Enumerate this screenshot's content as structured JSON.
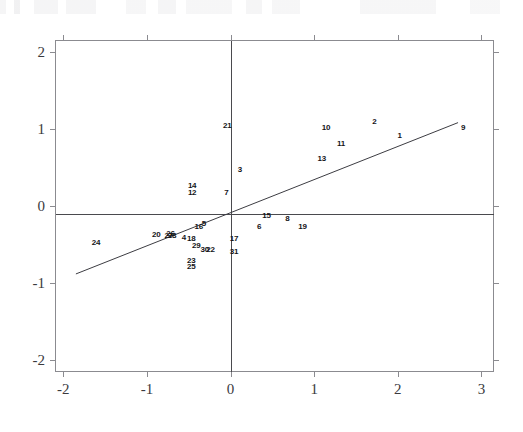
{
  "chart_data": {
    "type": "scatter",
    "title": "",
    "subtitle": "",
    "xlabel": "",
    "ylabel": "",
    "xlim": [
      -2.1,
      3.15
    ],
    "ylim": [
      -2.15,
      2.15
    ],
    "xticks": [
      "-2",
      "-1",
      "0",
      "1",
      "2",
      "3"
    ],
    "xtick_values": [
      -2,
      -1,
      0,
      1,
      2,
      3
    ],
    "yticks": [
      "2",
      "1",
      "0",
      "-1",
      "-2"
    ],
    "ytick_values": [
      2,
      1,
      0,
      -1,
      -2
    ],
    "grid": false,
    "legend": null,
    "point_style": "numeric-text-labels",
    "reference_lines": [
      {
        "name": "horizontal-reference-line",
        "orientation": "horizontal",
        "y": -0.1
      },
      {
        "name": "vertical-reference-line",
        "orientation": "vertical",
        "x": 0.0
      }
    ],
    "fit_line": {
      "name": "regression-line",
      "x_start": -1.85,
      "y_start": -0.88,
      "x_end": 2.72,
      "y_end": 1.08,
      "slope": 0.429,
      "intercept": -0.086
    },
    "points": [
      {
        "label": "1",
        "x": 2.02,
        "y": 0.92
      },
      {
        "label": "2",
        "x": 1.72,
        "y": 1.1
      },
      {
        "label": "3",
        "x": 0.11,
        "y": 0.48
      },
      {
        "label": "4",
        "x": -0.56,
        "y": -0.4
      },
      {
        "label": "5",
        "x": -0.32,
        "y": -0.22
      },
      {
        "label": "6",
        "x": 0.34,
        "y": -0.26
      },
      {
        "label": "7",
        "x": -0.05,
        "y": 0.18
      },
      {
        "label": "8",
        "x": 0.68,
        "y": -0.16
      },
      {
        "label": "9",
        "x": 2.78,
        "y": 1.02
      },
      {
        "label": "10",
        "x": 1.14,
        "y": 1.02
      },
      {
        "label": "11",
        "x": 1.32,
        "y": 0.82
      },
      {
        "label": "12",
        "x": -0.46,
        "y": 0.18
      },
      {
        "label": "13",
        "x": 1.09,
        "y": 0.62
      },
      {
        "label": "14",
        "x": -0.46,
        "y": 0.27
      },
      {
        "label": "15",
        "x": 0.43,
        "y": -0.12
      },
      {
        "label": "16",
        "x": -0.38,
        "y": -0.26
      },
      {
        "label": "17",
        "x": 0.04,
        "y": -0.41
      },
      {
        "label": "18",
        "x": -0.47,
        "y": -0.42
      },
      {
        "label": "19",
        "x": 0.86,
        "y": -0.26
      },
      {
        "label": "20",
        "x": -0.89,
        "y": -0.36
      },
      {
        "label": "21",
        "x": -0.04,
        "y": 1.05
      },
      {
        "label": "22",
        "x": -0.24,
        "y": -0.56
      },
      {
        "label": "23",
        "x": -0.47,
        "y": -0.7
      },
      {
        "label": "24",
        "x": -1.61,
        "y": -0.46
      },
      {
        "label": "25",
        "x": -0.47,
        "y": -0.78
      },
      {
        "label": "26",
        "x": -0.72,
        "y": -0.35
      },
      {
        "label": "27",
        "x": -0.74,
        "y": -0.38
      },
      {
        "label": "28",
        "x": -0.7,
        "y": -0.37
      },
      {
        "label": "29",
        "x": -0.41,
        "y": -0.5
      },
      {
        "label": "30",
        "x": -0.31,
        "y": -0.56
      },
      {
        "label": "31",
        "x": 0.04,
        "y": -0.58
      }
    ]
  }
}
